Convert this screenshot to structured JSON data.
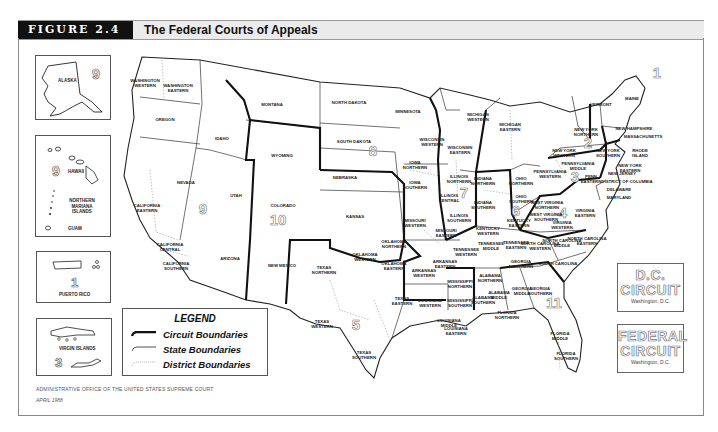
{
  "header": {
    "figure_label": "FIGURE 2.4",
    "title": "The Federal Courts of Appeals"
  },
  "insets": {
    "alaska": {
      "label": "ALASKA",
      "circuit": "9"
    },
    "pacific": {
      "hawaii": "HAWAII",
      "mariana": "NORTHERN MARIANA ISLANDS",
      "guam": "GUAM",
      "circuit": "9"
    },
    "puerto_rico": {
      "label": "PUERTO RICO",
      "circuit": "1"
    },
    "virgin_islands": {
      "label": "VIRGIN ISLANDS",
      "circuit": "3"
    }
  },
  "legend": {
    "title": "LEGEND",
    "items": [
      {
        "label": "Circuit Boundaries",
        "style": "thick"
      },
      {
        "label": "State Boundaries",
        "style": "thin"
      },
      {
        "label": "District Boundaries",
        "style": "dotted"
      }
    ]
  },
  "special_courts": {
    "dc": {
      "line1": "D.C.",
      "line2": "CIRCUIT",
      "location": "Washington, D.C."
    },
    "federal": {
      "line1": "FEDERAL",
      "line2": "CIRCUIT",
      "location": "Washington, D.C."
    }
  },
  "circuits": [
    {
      "number": "1",
      "x": 657,
      "y": 78
    },
    {
      "number": "2",
      "x": 588,
      "y": 148
    },
    {
      "number": "3",
      "x": 575,
      "y": 182
    },
    {
      "number": "4",
      "x": 563,
      "y": 218
    },
    {
      "number": "5",
      "x": 356,
      "y": 330
    },
    {
      "number": "6",
      "x": 516,
      "y": 216
    },
    {
      "number": "7",
      "x": 464,
      "y": 198
    },
    {
      "number": "8",
      "x": 373,
      "y": 156
    },
    {
      "number": "9",
      "x": 203,
      "y": 214
    },
    {
      "number": "10",
      "x": 278,
      "y": 225
    },
    {
      "number": "11",
      "x": 554,
      "y": 308
    }
  ],
  "districts": [
    {
      "name": "WASHINGTON WESTERN",
      "x": 145,
      "y": 82
    },
    {
      "name": "WASHINGTON EASTERN",
      "x": 178,
      "y": 87
    },
    {
      "name": "MONTANA",
      "x": 272,
      "y": 106
    },
    {
      "name": "OREGON",
      "x": 165,
      "y": 121
    },
    {
      "name": "IDAHO",
      "x": 222,
      "y": 140
    },
    {
      "name": "WYOMING",
      "x": 282,
      "y": 157
    },
    {
      "name": "NEVADA",
      "x": 186,
      "y": 184
    },
    {
      "name": "CALIFORNIA EASTERN",
      "x": 147,
      "y": 207
    },
    {
      "name": "UTAH",
      "x": 236,
      "y": 197
    },
    {
      "name": "COLORADO",
      "x": 283,
      "y": 207
    },
    {
      "name": "CALIFORNIA CENTRAL",
      "x": 170,
      "y": 246
    },
    {
      "name": "CALIFORNIA SOUTHERN",
      "x": 176,
      "y": 265
    },
    {
      "name": "ARIZONA",
      "x": 230,
      "y": 260
    },
    {
      "name": "NEW MEXICO",
      "x": 282,
      "y": 267
    },
    {
      "name": "NORTH DAKOTA",
      "x": 349,
      "y": 104
    },
    {
      "name": "SOUTH DAKOTA",
      "x": 354,
      "y": 143
    },
    {
      "name": "NEBRASKA",
      "x": 345,
      "y": 179
    },
    {
      "name": "KANSAS",
      "x": 355,
      "y": 218
    },
    {
      "name": "MINNESOTA",
      "x": 408,
      "y": 113
    },
    {
      "name": "IOWA NORTHERN",
      "x": 415,
      "y": 164
    },
    {
      "name": "IOWA SOUTHERN",
      "x": 415,
      "y": 184
    },
    {
      "name": "MISSOURI WESTERN",
      "x": 415,
      "y": 222
    },
    {
      "name": "MISSOURI EASTERN",
      "x": 446,
      "y": 232
    },
    {
      "name": "OKLAHOMA NORTHERN",
      "x": 394,
      "y": 243
    },
    {
      "name": "OKLAHOMA WESTERN",
      "x": 365,
      "y": 256
    },
    {
      "name": "OKLAHOMA EASTERN",
      "x": 394,
      "y": 265
    },
    {
      "name": "ARKANSAS EASTERN",
      "x": 445,
      "y": 263
    },
    {
      "name": "ARKANSAS WESTERN",
      "x": 424,
      "y": 272
    },
    {
      "name": "TEXAS NORTHERN",
      "x": 324,
      "y": 269
    },
    {
      "name": "TEXAS EASTERN",
      "x": 402,
      "y": 300
    },
    {
      "name": "TEXAS WESTERN",
      "x": 322,
      "y": 323
    },
    {
      "name": "TEXAS SOUTHERN",
      "x": 364,
      "y": 354
    },
    {
      "name": "LOUISIANA WESTERN",
      "x": 430,
      "y": 302
    },
    {
      "name": "LOUISIANA MIDDLE",
      "x": 449,
      "y": 322
    },
    {
      "name": "LOUISIANA EASTERN",
      "x": 456,
      "y": 330
    },
    {
      "name": "WISCONSIN WESTERN",
      "x": 432,
      "y": 141
    },
    {
      "name": "WISCONSIN EASTERN",
      "x": 460,
      "y": 149
    },
    {
      "name": "MICHIGAN WESTERN",
      "x": 478,
      "y": 116
    },
    {
      "name": "MICHIGAN EASTERN",
      "x": 510,
      "y": 126
    },
    {
      "name": "ILLINOIS NORTHERN",
      "x": 459,
      "y": 178
    },
    {
      "name": "ILLINOIS CENTRAL",
      "x": 449,
      "y": 197
    },
    {
      "name": "ILLINOIS SOUTHERN",
      "x": 459,
      "y": 217
    },
    {
      "name": "INDIANA NORTHERN",
      "x": 483,
      "y": 180
    },
    {
      "name": "INDIANA SOUTHERN",
      "x": 483,
      "y": 204
    },
    {
      "name": "OHIO NORTHERN",
      "x": 521,
      "y": 180
    },
    {
      "name": "OHIO SOUTHERN",
      "x": 521,
      "y": 198
    },
    {
      "name": "KENTUCKY EASTERN",
      "x": 519,
      "y": 222
    },
    {
      "name": "KENTUCKY WESTERN",
      "x": 488,
      "y": 230
    },
    {
      "name": "TENNESSEE WESTERN",
      "x": 466,
      "y": 251
    },
    {
      "name": "TENNESSEE MIDDLE",
      "x": 491,
      "y": 245
    },
    {
      "name": "TENNESSEE EASTERN",
      "x": 516,
      "y": 244
    },
    {
      "name": "MISSISSIPPI NORTHERN",
      "x": 460,
      "y": 283
    },
    {
      "name": "MISSISSIPPI SOUTHERN",
      "x": 460,
      "y": 302
    },
    {
      "name": "ALABAMA NORTHERN",
      "x": 490,
      "y": 277
    },
    {
      "name": "ALABAMA MIDDLE",
      "x": 499,
      "y": 294
    },
    {
      "name": "ALABAMA SOUTHERN",
      "x": 483,
      "y": 299
    },
    {
      "name": "GEORGIA NORTHERN",
      "x": 521,
      "y": 263
    },
    {
      "name": "GEORGIA MIDDLE",
      "x": 522,
      "y": 290
    },
    {
      "name": "GEORGIA SOUTHERN",
      "x": 540,
      "y": 290
    },
    {
      "name": "FLORIDA NORTHERN",
      "x": 507,
      "y": 314
    },
    {
      "name": "FLORIDA MIDDLE",
      "x": 560,
      "y": 335
    },
    {
      "name": "FLORIDA SOUTHERN",
      "x": 566,
      "y": 355
    },
    {
      "name": "SOUTH CAROLINA",
      "x": 558,
      "y": 265
    },
    {
      "name": "NORTH CAROLINA MIDDLE",
      "x": 562,
      "y": 242
    },
    {
      "name": "NORTH CAROLINA EASTERN",
      "x": 587,
      "y": 240
    },
    {
      "name": "NORTH CAROLINA WESTERN",
      "x": 540,
      "y": 245
    },
    {
      "name": "VIRGINIA WESTERN",
      "x": 562,
      "y": 224
    },
    {
      "name": "VIRGINIA EASTERN",
      "x": 585,
      "y": 212
    },
    {
      "name": "WEST VIRGINIA NORTHERN",
      "x": 547,
      "y": 204
    },
    {
      "name": "WEST VIRGINIA SOUTHERN",
      "x": 546,
      "y": 216
    },
    {
      "name": "PENNSYLVANIA WESTERN",
      "x": 550,
      "y": 173
    },
    {
      "name": "PENNSYLVANIA MIDDLE",
      "x": 578,
      "y": 165
    },
    {
      "name": "PENN EASTERN",
      "x": 591,
      "y": 178
    },
    {
      "name": "NEW YORK WESTERN",
      "x": 564,
      "y": 152
    },
    {
      "name": "NEW YORK NORTHERN",
      "x": 586,
      "y": 131
    },
    {
      "name": "NEW YORK SOUTHERN",
      "x": 608,
      "y": 152
    },
    {
      "name": "NEW YORK EASTERN",
      "x": 630,
      "y": 167
    },
    {
      "name": "NEW JERSEY",
      "x": 622,
      "y": 175
    },
    {
      "name": "DISTRICT OF COLUMBIA",
      "x": 627,
      "y": 183
    },
    {
      "name": "DELAWARE",
      "x": 619,
      "y": 191
    },
    {
      "name": "MARYLAND",
      "x": 619,
      "y": 199
    },
    {
      "name": "VERMONT",
      "x": 601,
      "y": 106
    },
    {
      "name": "MAINE",
      "x": 632,
      "y": 100
    },
    {
      "name": "NEW HAMPSHIRE",
      "x": 634,
      "y": 130
    },
    {
      "name": "MASSACHUSETTS",
      "x": 643,
      "y": 138
    },
    {
      "name": "RHODE ISLAND",
      "x": 640,
      "y": 152
    }
  ],
  "footer": {
    "source": "ADMINISTRATIVE OFFICE OF THE UNITED STATES SUPREME COURT",
    "date": "APRIL 1988"
  }
}
